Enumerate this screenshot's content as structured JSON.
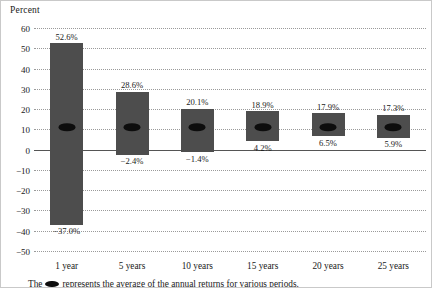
{
  "chart_data": {
    "type": "bar",
    "title": "",
    "ylabel": "Percent",
    "xlabel": "",
    "ylim": [
      -50,
      60
    ],
    "ytick_step": 10,
    "yticks": [
      "60",
      "50",
      "40",
      "30",
      "20",
      "10",
      "0",
      "-10",
      "-20",
      "-30",
      "-40",
      "-50"
    ],
    "grid": true,
    "legend": "none",
    "categories": [
      "1 year",
      "5 years",
      "10 years",
      "15 years",
      "20 years",
      "25 years"
    ],
    "series": [
      {
        "name": "Best annual return",
        "values": [
          52.6,
          28.6,
          20.1,
          18.9,
          17.9,
          17.3
        ]
      },
      {
        "name": "Worst annual return",
        "values": [
          -37.0,
          -2.4,
          -1.4,
          4.2,
          6.5,
          5.9
        ]
      },
      {
        "name": "Average annual return",
        "values": [
          11.0,
          11.0,
          11.0,
          11.0,
          11.0,
          11.0
        ]
      }
    ],
    "top_labels": [
      "52.6%",
      "28.6%",
      "20.1%",
      "18.9%",
      "17.9%",
      "17.3%"
    ],
    "bottom_labels": [
      "-37.0%",
      "-2.4%",
      "-1.4%",
      "4.2%",
      "6.5%",
      "5.9%"
    ],
    "marker_shape": "ellipse",
    "bar_color": "#4d4d4d",
    "marker_color": "#0d0d0d",
    "zero_line_color": "#555555",
    "gridline_color": "#9a9a9a"
  },
  "footnote": {
    "prefix": "The",
    "suffix": "represents the average of the annual returns for various periods."
  }
}
